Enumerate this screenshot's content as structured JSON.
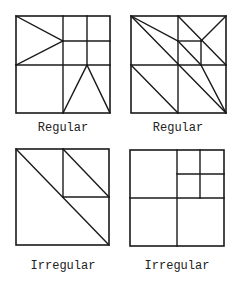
{
  "figure": {
    "stroke_color": "#1a1a1a",
    "panels": [
      {
        "label": "Regular",
        "box": [
          16,
          16,
          110,
          113
        ],
        "lines": [
          [
            63,
            16,
            63,
            113
          ],
          [
            16,
            65,
            110,
            65
          ],
          [
            87,
            16,
            87,
            65
          ],
          [
            63,
            41,
            110,
            41
          ],
          [
            16,
            16,
            63,
            41
          ],
          [
            16,
            65,
            63,
            41
          ],
          [
            63,
            113,
            87,
            65
          ],
          [
            87,
            65,
            110,
            113
          ]
        ]
      },
      {
        "label": "Regular",
        "box": [
          131,
          16,
          226,
          113
        ],
        "lines": [
          [
            178,
            16,
            178,
            113
          ],
          [
            131,
            65,
            226,
            65
          ],
          [
            178,
            41,
            201,
            41
          ],
          [
            201,
            41,
            201,
            65
          ],
          [
            178,
            16,
            226,
            65
          ],
          [
            226,
            16,
            201,
            41
          ],
          [
            131,
            16,
            178,
            41
          ],
          [
            178,
            41,
            201,
            65
          ],
          [
            201,
            65,
            226,
            113
          ],
          [
            131,
            16,
            226,
            113
          ],
          [
            131,
            65,
            178,
            113
          ]
        ]
      },
      {
        "label": "Irregular",
        "box": [
          16,
          149,
          109,
          245
        ],
        "lines": [
          [
            16,
            149,
            109,
            245
          ],
          [
            63,
            149,
            63,
            197
          ],
          [
            63,
            197,
            109,
            197
          ],
          [
            63,
            149,
            109,
            197
          ]
        ]
      },
      {
        "label": "Irregular",
        "box": [
          130,
          150,
          224,
          246
        ],
        "lines": [
          [
            177,
            150,
            177,
            246
          ],
          [
            130,
            198,
            224,
            198
          ],
          [
            200,
            150,
            200,
            198
          ],
          [
            177,
            174,
            224,
            174
          ]
        ]
      }
    ]
  }
}
